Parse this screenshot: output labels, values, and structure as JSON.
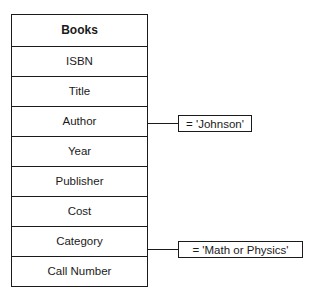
{
  "table": {
    "title": "Books",
    "fields": [
      "ISBN",
      "Title",
      "Author",
      "Year",
      "Publisher",
      "Cost",
      "Category",
      "Call Number"
    ]
  },
  "conditions": [
    {
      "field": "Author",
      "text": "= 'Johnson'"
    },
    {
      "field": "Category",
      "text": "= 'Math or Physics'"
    }
  ]
}
